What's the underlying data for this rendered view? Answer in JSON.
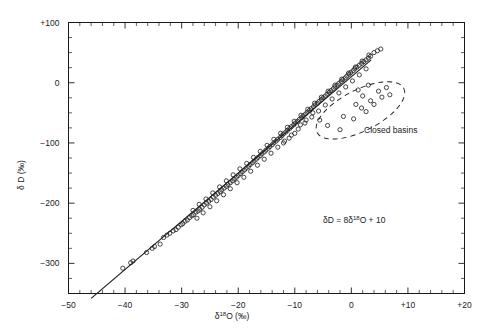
{
  "figure": {
    "background_color": "#ffffff",
    "ink_color": "#1a1a1a"
  },
  "chart_data": {
    "type": "scatter",
    "title": "",
    "subtitle": "",
    "xlabel": "δ 18O (‰)",
    "xlabel_parts": {
      "symbol": "δ",
      "superscript": "18",
      "element": "O",
      "units": "(‰)"
    },
    "ylabel": "δ D (‰)",
    "ylabel_parts": {
      "symbol": "δ",
      "element": "D",
      "units": "(‰)"
    },
    "xlim": [
      -50,
      20
    ],
    "ylim": [
      -350,
      100
    ],
    "x_major_ticks": [
      -50,
      -40,
      -30,
      -20,
      -10,
      0,
      10,
      20
    ],
    "x_tick_labels": [
      "−50",
      "−40",
      "−30",
      "−20",
      "−10",
      "0",
      "+10",
      "+20"
    ],
    "x_minor_step": 2,
    "y_major_ticks": [
      100,
      0,
      -100,
      -200,
      -300
    ],
    "y_tick_labels": [
      "+100",
      "0",
      "−100",
      "−200",
      "−300"
    ],
    "y_minor_step": 25,
    "grid": false,
    "legend_position": "none",
    "tick_direction": "in",
    "annotations": [
      {
        "name": "meteoric-water-line-equation",
        "text": "δD = 8δ 18O + 10",
        "parts": {
          "lead": "δD = 8δ",
          "superscript": "18",
          "tail": "O + 10"
        },
        "x": 0.5,
        "y": -233
      },
      {
        "name": "closed-basins-label",
        "text": "Closed basins",
        "x": 1.0,
        "y": -78
      }
    ],
    "series": [
      {
        "name": "Meteoric waters",
        "marker": "open-circle",
        "marker_size_px": 4.2,
        "points": [
          [
            -40.4,
            -308
          ],
          [
            -39.0,
            -299
          ],
          [
            -38.6,
            -296
          ],
          [
            -36.2,
            -282
          ],
          [
            -35.2,
            -275
          ],
          [
            -34.8,
            -272
          ],
          [
            -33.2,
            -257
          ],
          [
            -32.6,
            -253
          ],
          [
            -32.1,
            -250
          ],
          [
            -31.5,
            -246
          ],
          [
            -30.6,
            -240
          ],
          [
            -30.1,
            -236
          ],
          [
            -29.4,
            -230
          ],
          [
            -29.0,
            -228
          ],
          [
            -28.6,
            -224
          ],
          [
            -28.2,
            -221
          ],
          [
            -27.9,
            -219
          ],
          [
            -27.5,
            -215
          ],
          [
            -27.1,
            -213
          ],
          [
            -26.8,
            -210
          ],
          [
            -26.4,
            -207
          ],
          [
            -26.0,
            -203
          ],
          [
            -25.6,
            -200
          ],
          [
            -25.2,
            -197
          ],
          [
            -24.8,
            -194
          ],
          [
            -24.4,
            -190
          ],
          [
            -24.0,
            -187
          ],
          [
            -23.6,
            -184
          ],
          [
            -23.2,
            -181
          ],
          [
            -22.9,
            -178
          ],
          [
            -22.5,
            -175
          ],
          [
            -22.1,
            -172
          ],
          [
            -21.8,
            -169
          ],
          [
            -21.4,
            -166
          ],
          [
            -21.0,
            -163
          ],
          [
            -20.7,
            -160
          ],
          [
            -20.3,
            -157
          ],
          [
            -20.0,
            -154
          ],
          [
            -19.6,
            -151
          ],
          [
            -19.3,
            -148
          ],
          [
            -18.9,
            -145
          ],
          [
            -18.6,
            -142
          ],
          [
            -18.2,
            -139
          ],
          [
            -17.9,
            -136
          ],
          [
            -17.5,
            -133
          ],
          [
            -17.2,
            -130
          ],
          [
            -16.8,
            -127
          ],
          [
            -16.5,
            -124
          ],
          [
            -16.1,
            -121
          ],
          [
            -15.8,
            -118
          ],
          [
            -15.4,
            -115
          ],
          [
            -15.1,
            -112
          ],
          [
            -14.7,
            -109
          ],
          [
            -14.4,
            -106
          ],
          [
            -14.0,
            -103
          ],
          [
            -13.7,
            -100
          ],
          [
            -13.3,
            -97
          ],
          [
            -13.0,
            -94
          ],
          [
            -12.6,
            -91
          ],
          [
            -12.3,
            -88
          ],
          [
            -12.0,
            -85
          ],
          [
            -11.6,
            -82
          ],
          [
            -11.3,
            -79
          ],
          [
            -10.9,
            -76
          ],
          [
            -10.6,
            -73
          ],
          [
            -10.2,
            -70
          ],
          [
            -9.9,
            -67
          ],
          [
            -9.5,
            -64
          ],
          [
            -9.2,
            -61
          ],
          [
            -8.8,
            -58
          ],
          [
            -8.5,
            -55
          ],
          [
            -8.1,
            -52
          ],
          [
            -7.8,
            -49
          ],
          [
            -7.4,
            -46
          ],
          [
            -7.1,
            -43
          ],
          [
            -6.7,
            -40
          ],
          [
            -6.4,
            -37
          ],
          [
            -6.0,
            -34
          ],
          [
            -5.7,
            -31
          ],
          [
            -5.3,
            -28
          ],
          [
            -5.0,
            -25
          ],
          [
            -4.6,
            -22
          ],
          [
            -4.3,
            -19
          ],
          [
            -3.9,
            -16
          ],
          [
            -3.6,
            -13
          ],
          [
            -3.2,
            -10
          ],
          [
            -2.9,
            -7
          ],
          [
            -2.5,
            -4
          ],
          [
            -2.2,
            -1
          ],
          [
            -1.8,
            2
          ],
          [
            -1.5,
            5
          ],
          [
            -1.1,
            8
          ],
          [
            -0.8,
            11
          ],
          [
            -0.4,
            14
          ],
          [
            -0.1,
            17
          ],
          [
            0.3,
            20
          ],
          [
            0.6,
            23
          ],
          [
            1.0,
            26
          ],
          [
            1.4,
            29
          ],
          [
            1.8,
            32
          ],
          [
            2.2,
            35
          ],
          [
            2.6,
            38
          ],
          [
            3.0,
            41
          ],
          [
            3.4,
            44
          ],
          [
            -27.3,
            -225
          ],
          [
            -26.2,
            -216
          ],
          [
            -25.0,
            -206
          ],
          [
            -23.8,
            -196
          ],
          [
            -22.6,
            -186
          ],
          [
            -21.4,
            -176
          ],
          [
            -20.2,
            -166
          ],
          [
            -19.0,
            -157
          ],
          [
            -17.8,
            -147
          ],
          [
            -16.6,
            -137
          ],
          [
            -15.4,
            -127
          ],
          [
            -14.2,
            -117
          ],
          [
            -13.0,
            -107
          ],
          [
            -11.8,
            -97
          ],
          [
            -10.6,
            -87
          ],
          [
            -9.4,
            -77
          ],
          [
            -8.2,
            -67
          ],
          [
            -7.0,
            -57
          ],
          [
            -5.8,
            -47
          ],
          [
            -4.6,
            -37
          ],
          [
            -3.4,
            -27
          ],
          [
            -2.2,
            -17
          ],
          [
            -1.0,
            -7
          ],
          [
            0.2,
            3
          ],
          [
            1.4,
            13
          ],
          [
            2.6,
            23
          ],
          [
            -28.0,
            -212
          ],
          [
            -26.9,
            -202
          ],
          [
            -25.7,
            -193
          ],
          [
            -24.5,
            -183
          ],
          [
            -23.3,
            -173
          ],
          [
            -22.1,
            -163
          ],
          [
            -20.9,
            -153
          ],
          [
            -19.7,
            -143
          ],
          [
            -18.5,
            -134
          ],
          [
            -17.3,
            -124
          ],
          [
            -16.1,
            -114
          ],
          [
            -14.9,
            -104
          ],
          [
            -13.7,
            -94
          ],
          [
            -12.5,
            -84
          ],
          [
            -11.3,
            -74
          ],
          [
            -10.1,
            -64
          ],
          [
            -8.9,
            -54
          ],
          [
            -7.7,
            -44
          ],
          [
            -6.5,
            -34
          ],
          [
            -5.3,
            -24
          ],
          [
            -4.1,
            -14
          ],
          [
            -2.9,
            -4
          ],
          [
            -1.7,
            6
          ],
          [
            -0.5,
            16
          ],
          [
            0.7,
            26
          ],
          [
            1.9,
            36
          ],
          [
            3.1,
            46
          ],
          [
            4.0,
            50
          ],
          [
            4.6,
            53
          ],
          [
            5.2,
            56
          ],
          [
            -12.0,
            -100
          ],
          [
            -11.0,
            -92
          ],
          [
            -10.0,
            -84
          ],
          [
            -9.0,
            -70
          ],
          [
            -8.0,
            -62
          ],
          [
            -6.8,
            -50
          ],
          [
            -33.8,
            -268
          ],
          [
            -31.0,
            -244
          ],
          [
            -29.8,
            -234
          ]
        ]
      },
      {
        "name": "Closed basins",
        "marker": "open-circle",
        "marker_size_px": 4.2,
        "points": [
          [
            -5.6,
            -62
          ],
          [
            -4.2,
            -71
          ],
          [
            -2.0,
            -78
          ],
          [
            -1.4,
            -56
          ],
          [
            0.4,
            -60
          ],
          [
            1.8,
            -42
          ],
          [
            2.6,
            -48
          ],
          [
            3.4,
            -30
          ],
          [
            4.0,
            -36
          ],
          [
            4.8,
            -14
          ],
          [
            6.2,
            -8
          ],
          [
            5.4,
            -24
          ],
          [
            2.0,
            -22
          ],
          [
            0.8,
            -36
          ],
          [
            3.0,
            -4
          ],
          [
            6.8,
            -20
          ],
          [
            1.2,
            -12
          ]
        ]
      }
    ],
    "reference_line": {
      "name": "Global Meteoric Water Line",
      "equation": "δD = 8δ 18O + 10",
      "slope": 8,
      "intercept": 10,
      "x_start": -46,
      "x_end": 3.5
    },
    "closed_basin_region": {
      "name": "Closed basins envelope",
      "shape": "ellipse-dashed",
      "center_x": 1.6,
      "center_y": -46,
      "radius_x_units": 8.6,
      "radius_y_units": 34,
      "rotation_deg": -27
    }
  }
}
